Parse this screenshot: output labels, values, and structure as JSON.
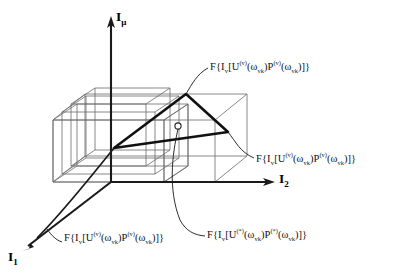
{
  "figure": {
    "background_color": "#ffffff",
    "line_color": "#111111",
    "box_color": "#555555",
    "width": 395,
    "height": 275
  },
  "axes": [
    {
      "id": "vertical",
      "name": "axis-label-i-mu",
      "base": "I",
      "subscript": "μ"
    },
    {
      "id": "right",
      "name": "axis-label-i2",
      "base": "I",
      "subscript": "2"
    },
    {
      "id": "front",
      "name": "axis-label-i1",
      "base": "I",
      "subscript": "1"
    }
  ],
  "labels": {
    "top": {
      "name": "formula-label-top",
      "prefix": "F{I",
      "v": "v",
      "mid1": "[U",
      "sup1": "(v)",
      "mid2": "(ω",
      "sub1": "vk",
      "mid3": ")P",
      "sup2": "(v)",
      "mid4": "(ω",
      "sub2": "vk",
      "suffix": ")]}"
    },
    "right": {
      "name": "formula-label-right",
      "prefix": "F{I",
      "v": "v",
      "mid1": "[U",
      "sup1": "(v)",
      "mid2": "(ω",
      "sub1": "vk",
      "mid3": ")P",
      "sup2": "(v)",
      "mid4": "(ω",
      "sub2": "vk",
      "suffix": ")]}"
    },
    "bottom_left": {
      "name": "formula-label-bottom-left",
      "prefix": "F{I",
      "v": "v",
      "mid1": "[U",
      "sup1": "(v)",
      "mid2": "(ω",
      "sub1": "vk",
      "mid3": ")P",
      "sup2": "(v)",
      "mid4": "(ω",
      "sub2": "vk",
      "suffix": ")]}"
    },
    "bottom_right": {
      "name": "formula-label-bottom-right",
      "prefix": "F{I",
      "v": "v",
      "mid1": "[U",
      "sup1": "(*)",
      "mid2": "(ω",
      "sub1": "vk",
      "mid3": ")P",
      "sup2": "(*)",
      "mid4": "(ω",
      "sub2": "vk",
      "suffix": ")]}"
    }
  },
  "markers": {
    "point": {
      "name": "point-marker",
      "shape": "circle"
    }
  }
}
